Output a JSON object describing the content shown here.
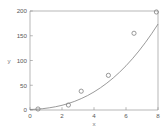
{
  "chart_data": {
    "type": "scatter",
    "title": "",
    "subtitle": "",
    "xlabel": "x",
    "ylabel": "y",
    "xlim": [
      0,
      8
    ],
    "ylim": [
      0,
      200
    ],
    "xticks": [
      0,
      2,
      4,
      6,
      8
    ],
    "yticks": [
      0,
      50,
      100,
      150,
      200
    ],
    "xtick_labels": [
      "0",
      "2",
      "4",
      "6",
      "8"
    ],
    "ytick_labels": [
      "0",
      "50",
      "100",
      "150",
      "200"
    ],
    "grid": false,
    "box": true,
    "legend": null,
    "series": [
      {
        "name": "data",
        "type": "scatter",
        "marker": "open-circle",
        "color": "#808080",
        "x": [
          0.5,
          2.4,
          3.2,
          4.9,
          6.5,
          7.9
        ],
        "y": [
          2,
          10,
          38,
          70,
          155,
          198
        ]
      },
      {
        "name": "fit",
        "type": "line",
        "color": "#808080",
        "x": [
          0.0,
          0.4,
          0.8,
          1.2,
          1.6,
          2.0,
          2.4,
          2.8,
          3.2,
          3.6,
          4.0,
          4.4,
          4.8,
          5.2,
          5.6,
          6.0,
          6.4,
          6.8,
          7.2,
          7.6,
          8.0
        ],
        "y": [
          1,
          1.6,
          2.7,
          4.4,
          6.6,
          9.5,
          13.2,
          17.6,
          23.0,
          29.2,
          36.5,
          44.8,
          54.2,
          64.7,
          76.4,
          89.3,
          103.5,
          119.0,
          135.8,
          154.0,
          173.6
        ]
      }
    ]
  },
  "axes": {
    "y_axis_title": "y",
    "x_axis_title": "x"
  },
  "colors": {
    "axis": "#9a9a9a",
    "marker": "#808080",
    "curve": "#808080",
    "text": "#5a5a5a",
    "background": "#ffffff"
  }
}
